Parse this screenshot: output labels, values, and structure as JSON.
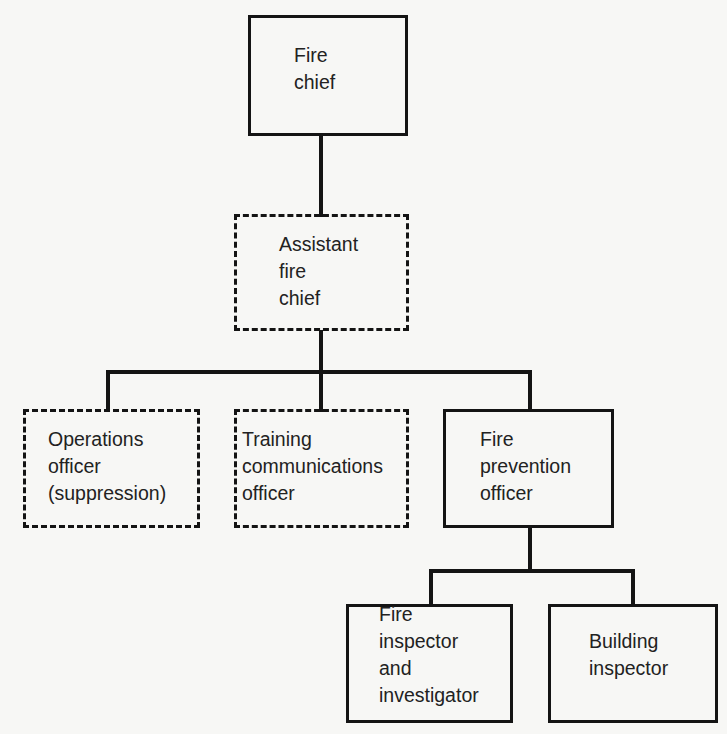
{
  "nodes": [
    {
      "id": "fire-chief",
      "label": "Fire\nchief",
      "style": "solid"
    },
    {
      "id": "assistant-fire-chief",
      "label": "Assistant\nfire\nchief",
      "style": "dashed"
    },
    {
      "id": "operations-officer",
      "label": "Operations\nofficer\n(suppression)",
      "style": "dashed"
    },
    {
      "id": "training-communications-officer",
      "label": "Training\ncommunications\nofficer",
      "style": "dashed"
    },
    {
      "id": "fire-prevention-officer",
      "label": "Fire\nprevention\nofficer",
      "style": "solid"
    },
    {
      "id": "fire-inspector-investigator",
      "label": "Fire\ninspector\nand\ninvestigator",
      "style": "solid"
    },
    {
      "id": "building-inspector",
      "label": "Building\ninspector",
      "style": "solid"
    }
  ],
  "edges": [
    {
      "from": "fire-chief",
      "to": "assistant-fire-chief"
    },
    {
      "from": "assistant-fire-chief",
      "to": "operations-officer"
    },
    {
      "from": "assistant-fire-chief",
      "to": "training-communications-officer"
    },
    {
      "from": "assistant-fire-chief",
      "to": "fire-prevention-officer"
    },
    {
      "from": "fire-prevention-officer",
      "to": "fire-inspector-investigator"
    },
    {
      "from": "fire-prevention-officer",
      "to": "building-inspector"
    }
  ],
  "legend": {
    "solid": "established position",
    "dashed": "optional / combined position"
  }
}
